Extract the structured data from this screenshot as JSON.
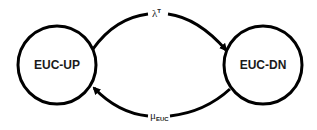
{
  "diagram": {
    "type": "state-transition",
    "states": [
      {
        "id": "up",
        "label": "EUC-UP",
        "cx": 57,
        "cy": 65,
        "r": 39
      },
      {
        "id": "dn",
        "label": "EUC-DN",
        "cx": 263,
        "cy": 65,
        "r": 39
      }
    ],
    "transitions": [
      {
        "from": "EUC-UP",
        "to": "EUC-DN",
        "symbol": "λ",
        "superscript": "T"
      },
      {
        "from": "EUC-DN",
        "to": "EUC-UP",
        "symbol": "μ",
        "subscript": "EUC"
      }
    ],
    "colors": {
      "stroke": "#000000",
      "background": "#ffffff",
      "text": "#1a1a1a"
    }
  }
}
